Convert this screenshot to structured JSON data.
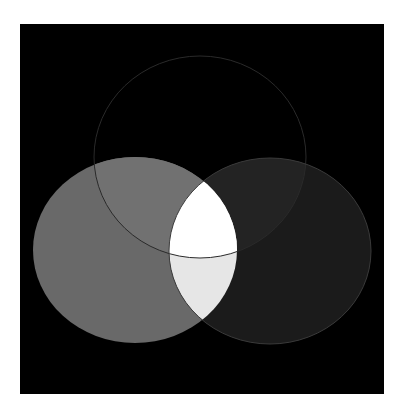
{
  "diagram": {
    "type": "venn",
    "set_count": 3,
    "background": {
      "x": 20,
      "y": 24,
      "width": 364,
      "height": 370,
      "color": "#000000"
    },
    "page_color": "#ffffff",
    "sets": [
      {
        "id": "top",
        "cx": 200,
        "cy": 157,
        "rx": 106,
        "ry": 101,
        "fill": "#000000",
        "stroke": "#2a2a2a"
      },
      {
        "id": "left",
        "cx": 135,
        "cy": 250,
        "rx": 102,
        "ry": 93,
        "fill": "#696969",
        "stroke": "#6a6a6a"
      },
      {
        "id": "right",
        "cx": 270,
        "cy": 251,
        "rx": 101,
        "ry": 93,
        "fill": "#1b1b1b",
        "stroke": "#3a3a3a"
      }
    ],
    "regions": {
      "left_only": "#696969",
      "right_only": "#1b1b1b",
      "top_and_left": "#717171",
      "top_and_right": "#232323",
      "left_and_right": "#e6e6e6",
      "all_three": "#ffffff"
    }
  }
}
